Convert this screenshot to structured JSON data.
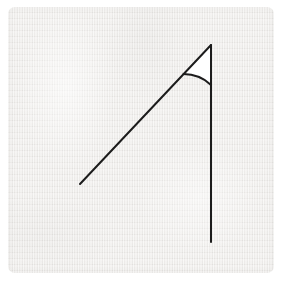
{
  "card": {
    "background_color": "#eceae7",
    "outer_background_color": "#ffffff",
    "corner_radius_px": 7,
    "material": "scanned-paper",
    "x": 8,
    "y": 7,
    "width": 266,
    "height": 266
  },
  "figure": {
    "stroke_color": "#1c1c1c",
    "stroke_width_px": 2,
    "sector_fill_color": "#ffffff",
    "vertex": {
      "label": "vertex",
      "x": 211,
      "y": 45
    },
    "rays": [
      {
        "name": "vertical-ray",
        "label": "vertical ray",
        "from_x": 211,
        "from_y": 45,
        "to_x": 211,
        "to_y": 242,
        "direction_degrees": 270,
        "length_px": 197
      },
      {
        "name": "slanted-ray",
        "label": "slanted ray",
        "from_x": 211,
        "from_y": 45,
        "to_x": 80,
        "to_y": 184,
        "direction_degrees": 227,
        "length_px": 191
      }
    ],
    "angle_marker": {
      "name": "angle-arc",
      "label": "interior angle sector",
      "radius_px": 40,
      "start_degrees": 90,
      "end_degrees": 133,
      "measure_degrees": 43,
      "filled": true
    }
  }
}
